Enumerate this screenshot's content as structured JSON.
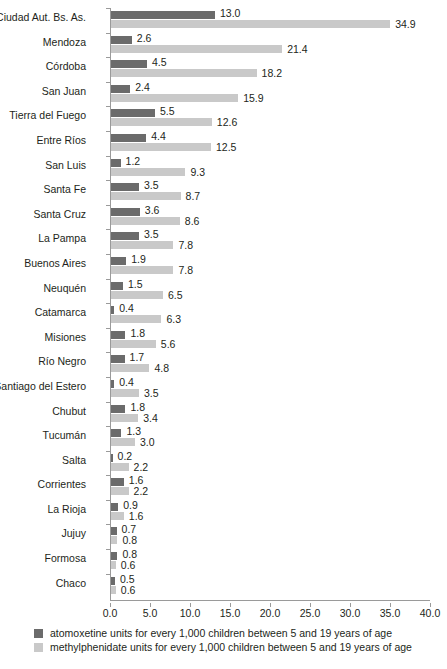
{
  "chart_data": {
    "type": "bar",
    "orientation": "horizontal",
    "title": "",
    "subtitle": "",
    "xlabel": "",
    "ylabel": "",
    "xlim": [
      0.0,
      40.0
    ],
    "xticks": [
      "0.0",
      "5.0",
      "10.0",
      "15.0",
      "20.0",
      "25.0",
      "30.0",
      "35.0",
      "40.0"
    ],
    "xtick_values": [
      0,
      5,
      10,
      15,
      20,
      25,
      30,
      35,
      40
    ],
    "grid": false,
    "legend_position": "bottom-left",
    "categories": [
      "Ciudad Aut. Bs. As.",
      "Mendoza",
      "Córdoba",
      "San Juan",
      "Tierra del Fuego",
      "Entre Ríos",
      "San Luis",
      "Santa Fe",
      "Santa Cruz",
      "La Pampa",
      "Buenos Aires",
      "Neuquén",
      "Catamarca",
      "Misiones",
      "Río Negro",
      "Santiago del Estero",
      "Chubut",
      "Tucumán",
      "Salta",
      "Corrientes",
      "La Rioja",
      "Jujuy",
      "Formosa",
      "Chaco"
    ],
    "series": [
      {
        "name": "atomoxetine units for every 1,000 children between 5 and 19 years of age",
        "color": "#6b6b6b",
        "values": [
          13.0,
          2.6,
          4.5,
          2.4,
          5.5,
          4.4,
          1.2,
          3.5,
          3.6,
          3.5,
          1.9,
          1.5,
          0.4,
          1.8,
          1.7,
          0.4,
          1.8,
          1.3,
          0.2,
          1.6,
          0.9,
          0.7,
          0.8,
          0.5
        ],
        "labels": [
          "13.0",
          "2.6",
          "4.5",
          "2.4",
          "5.5",
          "4.4",
          "1.2",
          "3.5",
          "3.6",
          "3.5",
          "1.9",
          "1.5",
          "0.4",
          "1.8",
          "1.7",
          "0.4",
          "1.8",
          "1.3",
          "0.2",
          "1.6",
          "0.9",
          "0.7",
          "0.8",
          "0.5"
        ]
      },
      {
        "name": "methylphenidate units for every 1,000 children between 5 and 19 years of age",
        "color": "#c9c9c9",
        "values": [
          34.9,
          21.4,
          18.2,
          15.9,
          12.6,
          12.5,
          9.3,
          8.7,
          8.6,
          7.8,
          7.8,
          6.5,
          6.3,
          5.6,
          4.8,
          3.5,
          3.4,
          3.0,
          2.2,
          2.2,
          1.6,
          0.8,
          0.6,
          0.6
        ],
        "labels": [
          "34.9",
          "21.4",
          "18.2",
          "15.9",
          "12.6",
          "12.5",
          "9.3",
          "8.7",
          "8.6",
          "7.8",
          "7.8",
          "6.5",
          "6.3",
          "5.6",
          "4.8",
          "3.5",
          "3.4",
          "3.0",
          "2.2",
          "2.2",
          "1.6",
          "0.8",
          "0.6",
          "0.6"
        ]
      }
    ]
  },
  "legend": {
    "items": [
      {
        "swatch": "dark",
        "label": "atomoxetine units for every 1,000 children between 5 and 19 years of age"
      },
      {
        "swatch": "light",
        "label": "methylphenidate units for every 1,000 children between 5 and 19 years of age"
      }
    ]
  }
}
